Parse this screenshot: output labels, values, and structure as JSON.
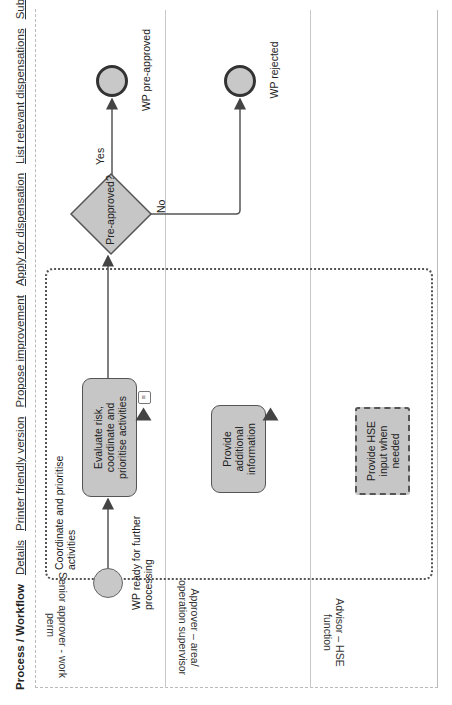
{
  "header": {
    "title": "Process / Workflow",
    "links": [
      "Details",
      "Printer friendly version",
      "Propose improvement",
      "Apply for dispensation",
      "List relevant dispensations",
      "Subscribe"
    ]
  },
  "lanes": [
    {
      "label": "Senior approver - work perm"
    },
    {
      "label": "Approver – area/ operation supervisor"
    },
    {
      "label": "Advisor – HSE function"
    }
  ],
  "group": {
    "label": "Coordinate and prioritise activities"
  },
  "events": {
    "start": {
      "label": "WP ready for further processing"
    },
    "end_approved": {
      "label": "WP pre-approved"
    },
    "end_rejected": {
      "label": "WP rejected"
    }
  },
  "tasks": [
    {
      "label": "Evaluate risk, coordinate and prioritise activities",
      "icons": [
        "document-icon",
        "warning-icon"
      ]
    },
    {
      "label": "Provide additional information",
      "icons": [
        "warning-icon"
      ]
    },
    {
      "label": "Provide HSE input when needed",
      "style": "dashed"
    }
  ],
  "gateway": {
    "label": "Pre-approved?",
    "yes_label": "Yes",
    "no_label": "No"
  },
  "colors": {
    "shape_fill": "#c6c6c6",
    "stroke": "#555555",
    "link": "#333333"
  }
}
